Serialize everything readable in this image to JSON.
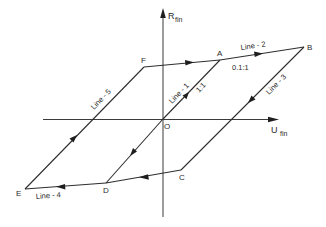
{
  "axes": {
    "vertical": {
      "label_main": "R",
      "label_sub": "fin",
      "x": 163,
      "y_top": 8,
      "y_bottom": 217
    },
    "horizontal": {
      "label_main": "U",
      "label_sub": "fin",
      "y": 119,
      "x_left": 43,
      "x_right": 278
    },
    "origin_label": "O"
  },
  "points": {
    "O": {
      "label": "O",
      "x": 163,
      "y": 119
    },
    "A": {
      "label": "A",
      "x": 220,
      "y": 60
    },
    "B": {
      "label": "B",
      "x": 304,
      "y": 47
    },
    "C": {
      "label": "C",
      "x": 181,
      "y": 170
    },
    "D": {
      "label": "D",
      "x": 106,
      "y": 183
    },
    "E": {
      "label": "E",
      "x": 25,
      "y": 189
    },
    "F": {
      "label": "F",
      "x": 144,
      "y": 67
    }
  },
  "lines": [
    {
      "name": "Line-1",
      "label": "Line - 1",
      "from": "O",
      "to": "A",
      "ratio": "1:1"
    },
    {
      "name": "Line-2",
      "label": "Line - 2",
      "from": "A",
      "to": "B",
      "ratio": "0.1:1"
    },
    {
      "name": "Line-3",
      "label": "Line - 3",
      "from": "B",
      "to": "C"
    },
    {
      "name": "Line-4",
      "label": "Line - 4",
      "from": "C",
      "to": "E"
    },
    {
      "name": "Line-5",
      "label": "Line - 5",
      "from": "E",
      "to": "F"
    }
  ],
  "labels": {
    "line1": "Line - 1",
    "line2": "Line - 2",
    "line3": "Line - 3",
    "line4": "Line - 4",
    "line5": "Line - 5",
    "ratio_line1": "1:1",
    "ratio_line2": "0.1:1",
    "pt_A": "A",
    "pt_B": "B",
    "pt_C": "C",
    "pt_D": "D",
    "pt_E": "E",
    "pt_F": "F",
    "pt_O": "O",
    "r_main": "R",
    "r_sub": "fin",
    "u_main": "U",
    "u_sub": "fin"
  },
  "colors": {
    "line": "#2e2e2e",
    "background": "#ffffff"
  }
}
